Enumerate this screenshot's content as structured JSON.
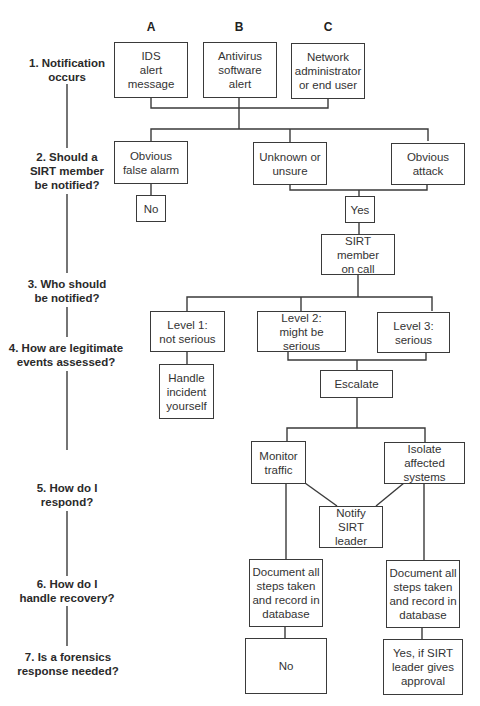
{
  "diagram": {
    "type": "flowchart",
    "columns": [
      {
        "label": "A",
        "x": 151
      },
      {
        "label": "B",
        "x": 239
      },
      {
        "label": "C",
        "x": 328
      }
    ],
    "steps": [
      {
        "label": "1. Notification\noccurs"
      },
      {
        "label": "2. Should a\nSIRT member\nbe notified?"
      },
      {
        "label": "3. Who should\nbe notified?"
      },
      {
        "label": "4. How are legitimate\nevents assessed?"
      },
      {
        "label": "5. How do I\nrespond?"
      },
      {
        "label": "6. How do I\nhandle recovery?"
      },
      {
        "label": "7. Is a forensics\nresponse needed?"
      }
    ],
    "nodes": {
      "ids_alert": "IDS\nalert\nmessage",
      "antivirus_alert": "Antivirus\nsoftware\nalert",
      "network_admin": "Network\nadministrator\nor end user",
      "false_alarm": "Obvious\nfalse alarm",
      "unknown": "Unknown or\nunsure",
      "obvious_attack": "Obvious\nattack",
      "no_notify": "No",
      "yes_notify": "Yes",
      "sirt_on_call": "SIRT member\non call",
      "level1": "Level 1:\nnot serious",
      "level2": "Level 2:\nmight be serious",
      "level3": "Level 3:\nserious",
      "handle_yourself": "Handle\nincident\nyourself",
      "escalate": "Escalate",
      "monitor_traffic": "Monitor\ntraffic",
      "isolate_systems": "Isolate affected\nsystems",
      "notify_leader": "Notify\nSIRT leader",
      "document_left": "Document all\nsteps taken\nand record in\ndatabase",
      "document_right": "Document all\nsteps taken\nand record in\ndatabase",
      "forensics_no": "No",
      "forensics_yes": "Yes, if SIRT\nleader gives\napproval"
    },
    "colors": {
      "line": "#3a3a3a",
      "text": "#2a2a2a",
      "background": "#ffffff"
    }
  }
}
